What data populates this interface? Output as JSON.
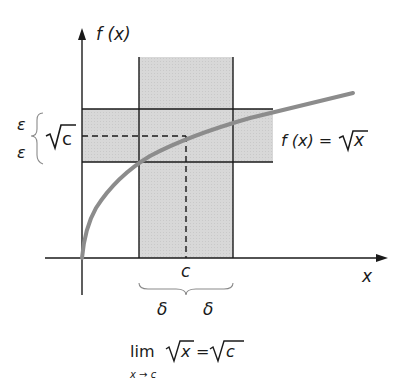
{
  "diagram": {
    "type": "epsilon-delta limit illustration",
    "y_axis_label": "f (x)",
    "x_axis_label": "x",
    "function_label": "f (x) = √x",
    "function_label_parts": {
      "lhs": "f (x) =",
      "rhs": "x"
    },
    "point_label": "c",
    "y_value_label": "c",
    "epsilon_labels": [
      "ε",
      "ε"
    ],
    "delta_labels": [
      "δ",
      "δ"
    ],
    "limit_expression": {
      "lim": "lim",
      "subscript": "x → c",
      "lhs_radicand": "x",
      "equals": "=",
      "rhs_radicand": "c"
    },
    "colors": {
      "curve": "#8c8c8c",
      "band_fill": "#d9d9d9",
      "lines": "#1a1a1a"
    }
  }
}
